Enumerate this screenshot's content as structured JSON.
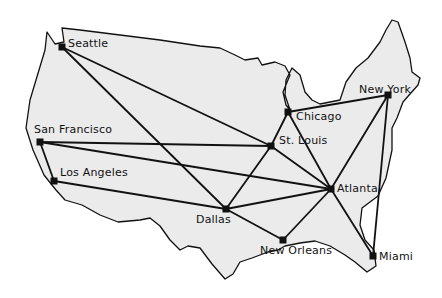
{
  "colors": {
    "land": "#ebebeb",
    "outline": "#111111",
    "edge": "#111111",
    "node": "#111111"
  },
  "nodes": [
    {
      "id": "seattle",
      "label": "Seattle",
      "x": 62,
      "y": 47,
      "lx": 68,
      "ly": 37
    },
    {
      "id": "sanfrancisco",
      "label": "San Francisco",
      "x": 40,
      "y": 142,
      "lx": 34,
      "ly": 123
    },
    {
      "id": "losangeles",
      "label": "Los Angeles",
      "x": 54,
      "y": 181,
      "lx": 60,
      "ly": 166
    },
    {
      "id": "stlouis",
      "label": "St. Louis",
      "x": 271,
      "y": 146,
      "lx": 279,
      "ly": 134
    },
    {
      "id": "chicago",
      "label": "Chicago",
      "x": 288,
      "y": 112,
      "lx": 296,
      "ly": 110
    },
    {
      "id": "newyork",
      "label": "New York",
      "x": 388,
      "y": 95,
      "lx": 359,
      "ly": 83
    },
    {
      "id": "atlanta",
      "label": "Atlanta",
      "x": 331,
      "y": 189,
      "lx": 337,
      "ly": 182
    },
    {
      "id": "dallas",
      "label": "Dallas",
      "x": 226,
      "y": 209,
      "lx": 196,
      "ly": 213
    },
    {
      "id": "neworleans",
      "label": "New Orleans",
      "x": 283,
      "y": 240,
      "lx": 260,
      "ly": 244
    },
    {
      "id": "miami",
      "label": "Miami",
      "x": 373,
      "y": 256,
      "lx": 379,
      "ly": 250
    }
  ],
  "edges": [
    [
      "seattle",
      "stlouis"
    ],
    [
      "seattle",
      "dallas"
    ],
    [
      "sanfrancisco",
      "stlouis"
    ],
    [
      "sanfrancisco",
      "atlanta"
    ],
    [
      "sanfrancisco",
      "losangeles"
    ],
    [
      "losangeles",
      "dallas"
    ],
    [
      "stlouis",
      "chicago"
    ],
    [
      "stlouis",
      "dallas"
    ],
    [
      "stlouis",
      "atlanta"
    ],
    [
      "chicago",
      "newyork"
    ],
    [
      "chicago",
      "atlanta"
    ],
    [
      "newyork",
      "atlanta"
    ],
    [
      "newyork",
      "miami"
    ],
    [
      "atlanta",
      "dallas"
    ],
    [
      "atlanta",
      "neworleans"
    ],
    [
      "atlanta",
      "miami"
    ],
    [
      "dallas",
      "neworleans"
    ]
  ]
}
